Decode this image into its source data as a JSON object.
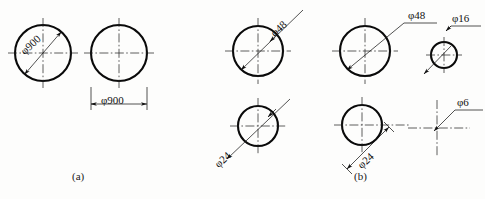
{
  "figure": {
    "background_color": "#fdfdfc",
    "line_color": "#0a0a0a",
    "panels": [
      {
        "id": "a",
        "caption": "(a)",
        "caption_x": 72,
        "caption_y": 172,
        "items": [
          {
            "name": "large-circle-diagonal-dim",
            "shape": "circle",
            "cx": 43,
            "cy": 53,
            "r": 28,
            "label": "φ900",
            "label_x": 20,
            "label_y": 58,
            "label_rotation": -43,
            "dim_style": "diagonal-inside"
          },
          {
            "name": "large-circle-horizontal-dim",
            "shape": "circle",
            "cx": 119,
            "cy": 53,
            "r": 28,
            "label": "φ900",
            "label_x": 104,
            "label_y": 98,
            "label_rotation": 0,
            "dim_style": "horizontal-below"
          }
        ]
      },
      {
        "id": "b",
        "caption": "(b)",
        "caption_x": 354,
        "caption_y": 172,
        "items": [
          {
            "name": "circle-phi48-diagonal",
            "shape": "circle",
            "cx": 258,
            "cy": 51,
            "r": 25,
            "label": "φ48",
            "label_x": 272,
            "label_y": 20,
            "label_rotation": -42,
            "dim_style": "diagonal-extended"
          },
          {
            "name": "circle-phi48-leader",
            "shape": "circle",
            "cx": 365,
            "cy": 51,
            "r": 25,
            "label": "φ48",
            "label_x": 408,
            "label_y": 13,
            "label_rotation": 0,
            "dim_style": "leader-shelf"
          },
          {
            "name": "circle-phi16-leader",
            "shape": "circle",
            "cx": 444,
            "cy": 55,
            "r": 13,
            "label": "φ16",
            "label_x": 448,
            "label_y": 14,
            "label_rotation": 0,
            "dim_style": "leader-shelf"
          },
          {
            "name": "circle-phi24-diagonal",
            "shape": "circle",
            "cx": 258,
            "cy": 126,
            "r": 20,
            "label": "φ24",
            "label_x": 216,
            "label_y": 150,
            "label_rotation": -42,
            "dim_style": "diagonal-extended"
          },
          {
            "name": "circle-phi24-offset",
            "shape": "circle",
            "cx": 362,
            "cy": 125,
            "r": 20,
            "label": "φ24",
            "label_x": 361,
            "label_y": 148,
            "label_rotation": -42,
            "dim_style": "offset-diagonal"
          },
          {
            "name": "centermark-phi6-leader",
            "shape": "centerline-cross",
            "cx": 437,
            "cy": 128,
            "r": 0,
            "label": "φ6",
            "label_x": 458,
            "label_y": 98,
            "label_rotation": 0,
            "dim_style": "leader-shelf"
          }
        ]
      }
    ],
    "symbols": {
      "diameter": "φ"
    }
  }
}
